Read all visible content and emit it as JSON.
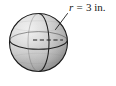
{
  "figure": {
    "kind": "sphere-diagram",
    "background_color": "#ffffff",
    "annotation": {
      "variable": "r",
      "equals": "=",
      "value": "3",
      "unit": "in.",
      "full_text": "r = 3 in.",
      "text_color": "#151515"
    },
    "sphere": {
      "center_x": 38.5,
      "center_y": 42.5,
      "radius_px": 29,
      "outline_color": "#1b1b1b",
      "fill_light": "#e8e8e8",
      "fill_mid": "#c9c9c9",
      "fill_dark": "#8d8d8d",
      "equator_color": "#2a2a2a",
      "meridian_color": "#2a2a2a"
    },
    "radius_line": {
      "style": "dashed",
      "color": "#1f1f1f",
      "from_x": 33,
      "from_y": 40,
      "to_x": 63,
      "to_y": 40
    },
    "leader_line": {
      "color": "#1f1f1f",
      "from_x": 67,
      "from_y": 14,
      "to_x": 56,
      "to_y": 29
    }
  }
}
